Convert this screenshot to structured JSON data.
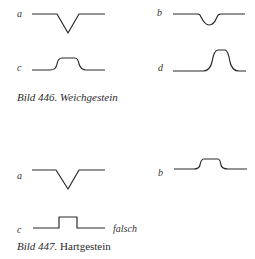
{
  "figure_446": {
    "caption_prefix": "Bild 446.",
    "caption_text": "Weichgestein",
    "panels": [
      {
        "label": "a",
        "shape": "sharp V-shaped notch"
      },
      {
        "label": "b",
        "shape": "rounded shallow dip"
      },
      {
        "label": "c",
        "shape": "flat-topped rounded bump"
      },
      {
        "label": "d",
        "shape": "tall narrow rounded peak"
      }
    ]
  },
  "figure_447": {
    "caption_prefix": "Bild 447.",
    "caption_text": "Hartgestein",
    "panels": [
      {
        "label": "a",
        "shape": "sharp V-shaped notch"
      },
      {
        "label": "b",
        "shape": "flat-topped rounded bump"
      },
      {
        "label": "c",
        "shape": "rectangular step bump",
        "note": "falsch"
      }
    ]
  },
  "colors": {
    "line": "#2a2a2a",
    "background": "#ffffff"
  }
}
